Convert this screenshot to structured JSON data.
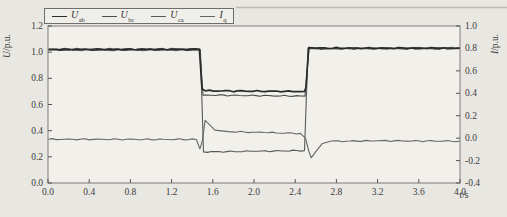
{
  "figure": {
    "background": "#e9e7e2",
    "plot_background": "#f2f0eb",
    "frame_color": "#7d7d7d"
  },
  "legend": {
    "items": [
      {
        "id": "uab",
        "label_main": "U",
        "label_sub": "ab",
        "color": "#2b2b2b"
      },
      {
        "id": "ubc",
        "label_main": "U",
        "label_sub": "bc",
        "color": "#4c4c4c"
      },
      {
        "id": "uca",
        "label_main": "U",
        "label_sub": "ca",
        "color": "#585858"
      },
      {
        "id": "iq",
        "label_main": "I",
        "label_sub": "q",
        "color": "#666666"
      }
    ]
  },
  "chart_data": {
    "type": "line",
    "grid": false,
    "legend_position": "top-left",
    "x_axis": {
      "label_var": "t",
      "label_rest": "/s",
      "range": [
        0,
        4.0
      ],
      "tick_step": 0.4,
      "tick_labels": [
        "0.0",
        "0.4",
        "0.8",
        "1.2",
        "1.6",
        "2.0",
        "2.4",
        "2.8",
        "3.2",
        "3.6",
        "4.0"
      ]
    },
    "y_left": {
      "label_var": "U",
      "label_rest": "/p.u.",
      "range": [
        0,
        1.2
      ],
      "tick_step": 0.2,
      "tick_labels": [
        "0.0",
        "0.2",
        "0.4",
        "0.6",
        "0.8",
        "1.0",
        "1.2"
      ]
    },
    "y_right": {
      "label_var": "I",
      "label_rest": "/p.u.",
      "range": [
        -0.4,
        1.0
      ],
      "tick_step": 0.2,
      "tick_labels": [
        "-0.4",
        "-0.2",
        "0.0",
        "0.2",
        "0.4",
        "0.6",
        "0.8",
        "1.0"
      ]
    },
    "series": [
      {
        "name": "U_ab",
        "axis": "left",
        "color": "#2b2b2b",
        "width": 1.7,
        "points": [
          [
            0,
            1.02
          ],
          [
            1.47,
            1.021
          ],
          [
            1.495,
            0.72
          ],
          [
            1.53,
            0.704
          ],
          [
            2.49,
            0.7
          ],
          [
            2.505,
            0.73
          ],
          [
            2.53,
            1.034
          ],
          [
            2.6,
            1.031
          ],
          [
            4,
            1.03
          ]
        ]
      },
      {
        "name": "U_bc",
        "axis": "left",
        "color": "#4c4c4c",
        "width": 1.1,
        "points": [
          [
            0,
            1.024
          ],
          [
            1.475,
            1.024
          ],
          [
            1.505,
            0.672
          ],
          [
            2.495,
            0.664
          ],
          [
            2.535,
            1.026
          ],
          [
            4,
            1.027
          ]
        ]
      },
      {
        "name": "U_ca",
        "axis": "left",
        "color": "#585858",
        "width": 1.1,
        "points": [
          [
            0,
            1.016
          ],
          [
            1.48,
            1.016
          ],
          [
            1.51,
            0.238
          ],
          [
            2.0,
            0.242
          ],
          [
            2.49,
            0.248
          ],
          [
            2.525,
            1.028
          ],
          [
            4,
            1.033
          ]
        ]
      },
      {
        "name": "I_q",
        "axis": "right",
        "color": "#666666",
        "width": 1.1,
        "points": [
          [
            0,
            -0.01
          ],
          [
            1.44,
            -0.012
          ],
          [
            1.475,
            -0.095
          ],
          [
            1.5,
            -0.02
          ],
          [
            1.525,
            0.158
          ],
          [
            1.56,
            0.128
          ],
          [
            1.62,
            0.072
          ],
          [
            1.75,
            0.058
          ],
          [
            2.1,
            0.05
          ],
          [
            2.45,
            0.042
          ],
          [
            2.5,
            0.0
          ],
          [
            2.53,
            -0.11
          ],
          [
            2.555,
            -0.175
          ],
          [
            2.6,
            -0.12
          ],
          [
            2.66,
            -0.05
          ],
          [
            2.74,
            -0.028
          ],
          [
            3.2,
            -0.024
          ],
          [
            4,
            -0.026
          ]
        ]
      }
    ]
  }
}
